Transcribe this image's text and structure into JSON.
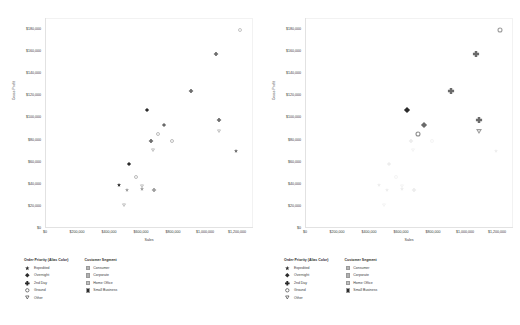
{
  "chart_data": [
    {
      "type": "scatter",
      "title": "",
      "panel": "left",
      "xlabel": "Sales",
      "ylabel": "Gross Profit",
      "xlim": [
        0,
        1300000
      ],
      "ylim": [
        0,
        190000
      ],
      "x_ticks": [
        "$0",
        "$200,000",
        "$400,000",
        "$600,000",
        "$800,000",
        "$1,000,000",
        "$1,200,000"
      ],
      "x_tick_values": [
        0,
        200000,
        400000,
        600000,
        800000,
        1000000,
        1200000
      ],
      "y_ticks": [
        "$0",
        "$20,000",
        "$40,000",
        "$60,000",
        "$80,000",
        "$100,000",
        "$120,000",
        "$140,000",
        "$160,000",
        "$180,000"
      ],
      "y_tick_values": [
        0,
        20000,
        40000,
        60000,
        80000,
        100000,
        120000,
        140000,
        160000,
        180000
      ],
      "grid": false,
      "legend_position": "below-left",
      "points": [
        {
          "x": 1215000,
          "y": 179000,
          "priority": "Ground",
          "segment": "Home Office",
          "emphasis": "normal"
        },
        {
          "x": 1065000,
          "y": 157000,
          "priority": "2nd Day",
          "segment": "Corporate",
          "emphasis": "normal"
        },
        {
          "x": 905000,
          "y": 124000,
          "priority": "2nd Day",
          "segment": "Corporate",
          "emphasis": "normal"
        },
        {
          "x": 630000,
          "y": 107000,
          "priority": "Overnight",
          "segment": "Small Business",
          "emphasis": "normal"
        },
        {
          "x": 740000,
          "y": 93000,
          "priority": "Overnight",
          "segment": "Corporate",
          "emphasis": "normal"
        },
        {
          "x": 1080000,
          "y": 98000,
          "priority": "2nd Day",
          "segment": "Corporate",
          "emphasis": "normal"
        },
        {
          "x": 1080000,
          "y": 88000,
          "priority": "Other",
          "segment": "Home Office",
          "emphasis": "normal"
        },
        {
          "x": 700000,
          "y": 85000,
          "priority": "Ground",
          "segment": "Consumer",
          "emphasis": "normal"
        },
        {
          "x": 790000,
          "y": 79000,
          "priority": "Ground",
          "segment": "Consumer",
          "emphasis": "normal"
        },
        {
          "x": 655000,
          "y": 79000,
          "priority": "2nd Day",
          "segment": "Corporate",
          "emphasis": "normal"
        },
        {
          "x": 670000,
          "y": 71000,
          "priority": "Other",
          "segment": "Home Office",
          "emphasis": "normal"
        },
        {
          "x": 1185000,
          "y": 70000,
          "priority": "Expedited",
          "segment": "Corporate",
          "emphasis": "normal"
        },
        {
          "x": 520000,
          "y": 58000,
          "priority": "Overnight",
          "segment": "Small Business",
          "emphasis": "normal"
        },
        {
          "x": 565000,
          "y": 46000,
          "priority": "Ground",
          "segment": "Consumer",
          "emphasis": "normal"
        },
        {
          "x": 455000,
          "y": 39000,
          "priority": "Expedited",
          "segment": "Small Business",
          "emphasis": "normal"
        },
        {
          "x": 600000,
          "y": 38000,
          "priority": "Other",
          "segment": "Home Office",
          "emphasis": "normal"
        },
        {
          "x": 603000,
          "y": 35000,
          "priority": "Expedited",
          "segment": "Home Office",
          "emphasis": "normal"
        },
        {
          "x": 505000,
          "y": 34000,
          "priority": "Expedited",
          "segment": "Home Office",
          "emphasis": "normal"
        },
        {
          "x": 675000,
          "y": 34000,
          "priority": "2nd Day",
          "segment": "Home Office",
          "emphasis": "normal"
        },
        {
          "x": 490000,
          "y": 21000,
          "priority": "Other",
          "segment": "Home Office",
          "emphasis": "normal"
        }
      ]
    },
    {
      "type": "scatter",
      "title": "",
      "panel": "right",
      "xlabel": "Sales",
      "ylabel": "Gross Profit",
      "xlim": [
        0,
        1300000
      ],
      "ylim": [
        0,
        190000
      ],
      "x_ticks": [
        "$0",
        "$200,000",
        "$400,000",
        "$600,000",
        "$800,000",
        "$1,000,000",
        "$1,200,000"
      ],
      "x_tick_values": [
        0,
        200000,
        400000,
        600000,
        800000,
        1000000,
        1200000
      ],
      "y_ticks": [
        "$0",
        "$20,000",
        "$40,000",
        "$60,000",
        "$80,000",
        "$100,000",
        "$120,000",
        "$140,000",
        "$160,000",
        "$180,000"
      ],
      "y_tick_values": [
        0,
        20000,
        40000,
        60000,
        80000,
        100000,
        120000,
        140000,
        160000,
        180000
      ],
      "grid": false,
      "legend_position": "below-left",
      "points": [
        {
          "x": 1215000,
          "y": 179000,
          "priority": "Ground",
          "segment": "Home Office",
          "emphasis": "highlight"
        },
        {
          "x": 1065000,
          "y": 157000,
          "priority": "2nd Day",
          "segment": "Corporate",
          "emphasis": "highlight"
        },
        {
          "x": 905000,
          "y": 124000,
          "priority": "2nd Day",
          "segment": "Corporate",
          "emphasis": "highlight"
        },
        {
          "x": 630000,
          "y": 107000,
          "priority": "Overnight",
          "segment": "Small Business",
          "emphasis": "highlight"
        },
        {
          "x": 740000,
          "y": 93000,
          "priority": "Overnight",
          "segment": "Corporate",
          "emphasis": "highlight"
        },
        {
          "x": 1080000,
          "y": 98000,
          "priority": "2nd Day",
          "segment": "Corporate",
          "emphasis": "highlight"
        },
        {
          "x": 1080000,
          "y": 88000,
          "priority": "Other",
          "segment": "Home Office",
          "emphasis": "highlight"
        },
        {
          "x": 700000,
          "y": 85000,
          "priority": "Ground",
          "segment": "Consumer",
          "emphasis": "highlight"
        },
        {
          "x": 790000,
          "y": 79000,
          "priority": "Ground",
          "segment": "Consumer",
          "emphasis": "faded"
        },
        {
          "x": 655000,
          "y": 79000,
          "priority": "2nd Day",
          "segment": "Corporate",
          "emphasis": "faded"
        },
        {
          "x": 670000,
          "y": 71000,
          "priority": "Other",
          "segment": "Home Office",
          "emphasis": "faded"
        },
        {
          "x": 1185000,
          "y": 70000,
          "priority": "Expedited",
          "segment": "Corporate",
          "emphasis": "faded"
        },
        {
          "x": 520000,
          "y": 58000,
          "priority": "Overnight",
          "segment": "Small Business",
          "emphasis": "faded"
        },
        {
          "x": 565000,
          "y": 46000,
          "priority": "Ground",
          "segment": "Consumer",
          "emphasis": "faded"
        },
        {
          "x": 455000,
          "y": 39000,
          "priority": "Expedited",
          "segment": "Small Business",
          "emphasis": "faded"
        },
        {
          "x": 600000,
          "y": 38000,
          "priority": "Other",
          "segment": "Home Office",
          "emphasis": "faded"
        },
        {
          "x": 603000,
          "y": 35000,
          "priority": "Expedited",
          "segment": "Home Office",
          "emphasis": "faded"
        },
        {
          "x": 505000,
          "y": 34000,
          "priority": "Expedited",
          "segment": "Home Office",
          "emphasis": "faded"
        },
        {
          "x": 675000,
          "y": 34000,
          "priority": "2nd Day",
          "segment": "Home Office",
          "emphasis": "faded"
        },
        {
          "x": 490000,
          "y": 21000,
          "priority": "Other",
          "segment": "Home Office",
          "emphasis": "faded"
        }
      ]
    }
  ],
  "legends": {
    "priority": {
      "title": "Order Priority (Alias Color)",
      "items": [
        {
          "label": "Expedited",
          "shape": "star",
          "icon": "star-marker-icon"
        },
        {
          "label": "Overnight",
          "shape": "diamond",
          "icon": "diamond-marker-icon"
        },
        {
          "label": "2nd Day",
          "shape": "plus",
          "icon": "plus-marker-icon"
        },
        {
          "label": "Ground",
          "shape": "circle",
          "icon": "circle-marker-icon"
        },
        {
          "label": "Other",
          "shape": "triangle",
          "icon": "triangle-down-marker-icon"
        }
      ]
    },
    "segment": {
      "title": "Customer Segment",
      "items": [
        {
          "label": "Consumer",
          "color": "#b5b5b5"
        },
        {
          "label": "Corporate",
          "color": "#b0b0b0"
        },
        {
          "label": "Home Office",
          "color": "#bfbfbf"
        },
        {
          "label": "Small Business",
          "color": "#2b2b2b"
        }
      ]
    }
  },
  "colors": {
    "axis_text": "#3a3a3a",
    "marker_dark": "#2b2b2b",
    "marker_mid": "#6d6d6d",
    "marker_light": "#a8a8a8",
    "faded": "#ededed",
    "frame": "#e2e2e2"
  }
}
